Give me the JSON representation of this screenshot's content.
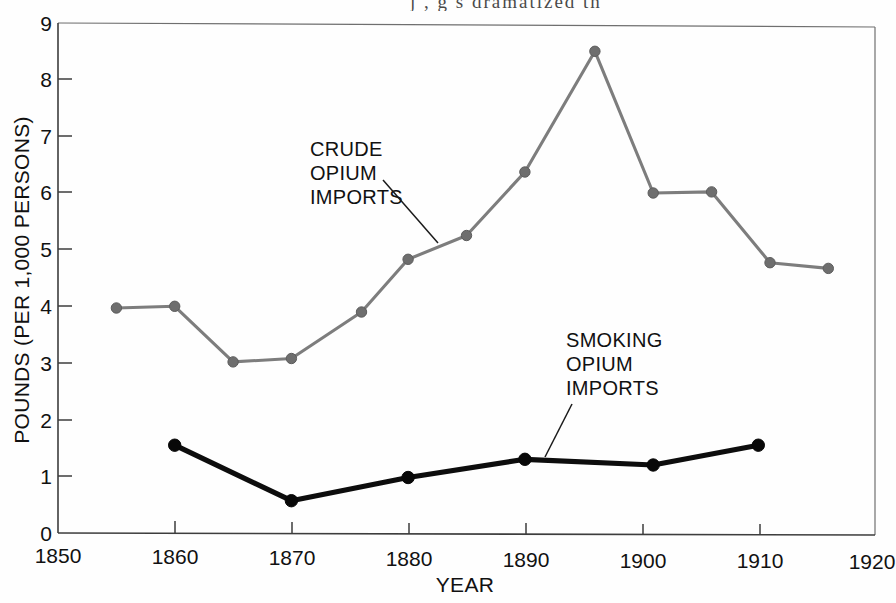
{
  "page": {
    "bleed_text": "j  ,  g        s    dramatized  th"
  },
  "chart_data": {
    "type": "line",
    "title": "",
    "subtitle": "",
    "xlabel": "YEAR",
    "ylabel": "POUNDS (PER 1,000 PERSONS)",
    "xlim": [
      1850,
      1920
    ],
    "ylim": [
      0,
      9
    ],
    "grid": false,
    "legend_position": "inline-annotations",
    "xticks": [
      1850,
      1860,
      1870,
      1880,
      1890,
      1900,
      1910,
      1920
    ],
    "xtick_labels": [
      "1850",
      "1860",
      "1870",
      "1880",
      "1890",
      "1900",
      "1910",
      "1920"
    ],
    "yticks": [
      0,
      1,
      2,
      3,
      4,
      5,
      6,
      7,
      8,
      9
    ],
    "ytick_labels": [
      "0",
      "1",
      "2",
      "3",
      "4",
      "5",
      "6",
      "7",
      "8",
      "9"
    ],
    "series": [
      {
        "name": "CRUDE OPIUM IMPORTS",
        "color": "#7d7d7d",
        "marker": "circle",
        "x": [
          1855,
          1860,
          1865,
          1870,
          1876,
          1880,
          1885,
          1890,
          1896,
          1901,
          1906,
          1911,
          1916
        ],
        "values": [
          3.97,
          4.0,
          3.02,
          3.08,
          3.9,
          4.83,
          5.25,
          6.37,
          8.5,
          6.0,
          6.02,
          4.77,
          4.67
        ]
      },
      {
        "name": "SMOKING OPIUM IMPORTS",
        "color": "#0d0d0d",
        "marker": "circle",
        "x": [
          1860,
          1870,
          1880,
          1890,
          1901,
          1910
        ],
        "values": [
          1.55,
          0.57,
          0.98,
          1.3,
          1.2,
          1.55
        ]
      }
    ],
    "annotations": [
      {
        "id": "crude-label",
        "lines": [
          "CRUDE",
          "OPIUM",
          "IMPORTS"
        ],
        "text_x": 1872,
        "text_y": 6.75,
        "leader_to_x": 1880,
        "leader_to_y": 4.9
      },
      {
        "id": "smoking-label",
        "lines": [
          "SMOKING",
          "OPIUM",
          "IMPORTS"
        ],
        "text_x": 1893,
        "text_y": 3.5,
        "leader_to_x": 1890,
        "leader_to_y": 1.35
      }
    ]
  }
}
